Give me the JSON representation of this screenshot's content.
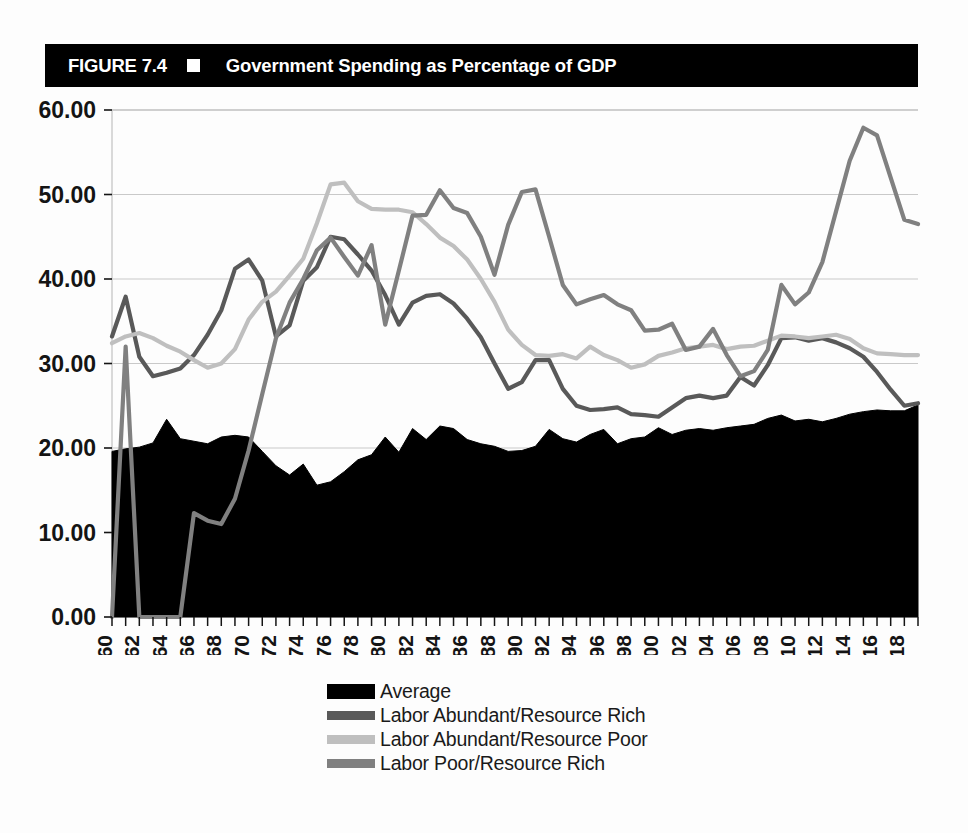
{
  "figure": {
    "label": "FIGURE 7.4",
    "title": "Government Spending as Percentage of GDP",
    "marker_icon": "white-square-icon"
  },
  "colors": {
    "title_bar_background": "#000000",
    "title_text": "#ffffff",
    "average_area": "#000000",
    "labor_abundant_resource_rich": "#595959",
    "labor_abundant_resource_poor": "#bfbfbf",
    "labor_poor_resource_rich": "#808080",
    "gridline": "#c9c9c9",
    "axis_text": "#141414",
    "plot_background": "#ffffff"
  },
  "legend": {
    "position": "below-axis",
    "items": [
      {
        "label": "Average",
        "color": "#000000",
        "style": "area",
        "swatch_icon": "black-area-swatch-icon"
      },
      {
        "label": "Labor Abundant/Resource Rich",
        "color": "#595959",
        "style": "line",
        "swatch_icon": "dark-gray-line-swatch-icon"
      },
      {
        "label": "Labor Abundant/Resource Poor",
        "color": "#bfbfbf",
        "style": "line",
        "swatch_icon": "light-gray-line-swatch-icon"
      },
      {
        "label": "Labor Poor/Resource Rich",
        "color": "#808080",
        "style": "line",
        "swatch_icon": "medium-gray-line-swatch-icon"
      }
    ]
  },
  "axes": {
    "y": {
      "min": 0,
      "max": 60,
      "step": 10,
      "tick_labels": [
        "60.00",
        "50.00",
        "40.00",
        "30.00",
        "20.00",
        "10.00",
        "0.00"
      ],
      "label": "",
      "grid": true
    },
    "x": {
      "min": 1960,
      "max": 2019,
      "label_step": 2,
      "tick_labels": [
        "1960",
        "1962",
        "1964",
        "1966",
        "1968",
        "1970",
        "1972",
        "1974",
        "1976",
        "1978",
        "1980",
        "1982",
        "1984",
        "1986",
        "1988",
        "1990",
        "1992",
        "1994",
        "1996",
        "1998",
        "2000",
        "2002",
        "2004",
        "2006",
        "2008",
        "2010",
        "2012",
        "2014",
        "2016",
        "2018"
      ],
      "label": "",
      "label_rotation": -90,
      "grid": false
    }
  },
  "chart_data": {
    "type": "line",
    "title": "Government Spending as Percentage of GDP",
    "xlabel": "",
    "ylabel": "",
    "ylim": [
      0,
      60
    ],
    "xlim": [
      1960,
      2019
    ],
    "grid": true,
    "legend_position": "bottom",
    "x": [
      1960,
      1961,
      1962,
      1963,
      1964,
      1965,
      1966,
      1967,
      1968,
      1969,
      1970,
      1971,
      1972,
      1973,
      1974,
      1975,
      1976,
      1977,
      1978,
      1979,
      1980,
      1981,
      1982,
      1983,
      1984,
      1985,
      1986,
      1987,
      1988,
      1989,
      1990,
      1991,
      1992,
      1993,
      1994,
      1995,
      1996,
      1997,
      1998,
      1999,
      2000,
      2001,
      2002,
      2003,
      2004,
      2005,
      2006,
      2007,
      2008,
      2009,
      2010,
      2011,
      2012,
      2013,
      2014,
      2015,
      2016,
      2017,
      2018,
      2019
    ],
    "series": [
      {
        "name": "Average",
        "color": "#000000",
        "type": "area",
        "values": [
          19.6,
          19.9,
          20.1,
          20.6,
          23.4,
          21.1,
          20.8,
          20.5,
          21.3,
          21.5,
          21.3,
          19.6,
          17.9,
          16.8,
          18.1,
          15.6,
          16.0,
          17.2,
          18.6,
          19.2,
          21.3,
          19.5,
          22.3,
          21.0,
          22.6,
          22.3,
          21.0,
          20.5,
          20.2,
          19.6,
          19.7,
          20.2,
          22.2,
          21.1,
          20.7,
          21.6,
          22.2,
          20.5,
          21.1,
          21.3,
          22.4,
          21.6,
          22.1,
          22.3,
          22.1,
          22.4,
          22.6,
          22.8,
          23.5,
          23.9,
          23.2,
          23.4,
          23.1,
          23.5,
          24.0,
          24.3,
          24.5,
          24.4,
          24.4,
          25.1
        ]
      },
      {
        "name": "Labor Abundant/Resource Rich",
        "color": "#595959",
        "type": "line",
        "values": [
          33.2,
          37.9,
          30.8,
          28.5,
          28.9,
          29.4,
          31.0,
          33.4,
          36.3,
          41.2,
          42.3,
          39.8,
          33.2,
          34.5,
          39.8,
          41.4,
          45.0,
          44.7,
          42.9,
          41.0,
          38.1,
          34.6,
          37.2,
          38.0,
          38.2,
          37.1,
          35.3,
          33.1,
          30.0,
          27.0,
          27.8,
          30.4,
          30.4,
          27.0,
          25.0,
          24.5,
          24.6,
          24.8,
          24.0,
          23.9,
          23.7,
          24.8,
          25.9,
          26.2,
          25.9,
          26.2,
          28.4,
          27.4,
          29.8,
          33.0,
          33.1,
          32.7,
          33.0,
          32.5,
          31.8,
          30.8,
          29.0,
          26.9,
          25.0,
          25.3
        ]
      },
      {
        "name": "Labor Abundant/Resource Poor",
        "color": "#bfbfbf",
        "type": "line",
        "values": [
          32.4,
          33.2,
          33.6,
          33.0,
          32.1,
          31.4,
          30.4,
          29.5,
          30.0,
          31.7,
          35.2,
          37.3,
          38.5,
          40.4,
          42.4,
          46.6,
          51.2,
          51.4,
          49.2,
          48.3,
          48.2,
          48.2,
          47.9,
          46.5,
          44.9,
          43.9,
          42.3,
          40.0,
          37.3,
          34.0,
          32.2,
          31.0,
          30.9,
          31.1,
          30.6,
          32.0,
          31.0,
          30.4,
          29.5,
          29.9,
          30.9,
          31.3,
          31.8,
          32.0,
          32.2,
          31.7,
          32.0,
          32.1,
          32.7,
          33.3,
          33.2,
          33.0,
          33.2,
          33.4,
          32.9,
          31.8,
          31.2,
          31.1,
          31.0,
          31.0
        ]
      },
      {
        "name": "Labor Poor/Resource Rich",
        "color": "#808080",
        "type": "line",
        "values": [
          0.0,
          32.0,
          0.0,
          0.0,
          0.0,
          0.0,
          12.3,
          11.4,
          11.0,
          14.0,
          19.7,
          26.4,
          33.0,
          37.2,
          40.0,
          43.4,
          44.9,
          42.6,
          40.4,
          44.0,
          34.6,
          41.0,
          47.5,
          47.6,
          50.5,
          48.4,
          47.8,
          45.0,
          40.5,
          46.4,
          50.3,
          50.6,
          45.0,
          39.3,
          37.0,
          37.6,
          38.1,
          37.0,
          36.3,
          33.9,
          34.0,
          34.7,
          31.6,
          32.0,
          34.1,
          31.0,
          28.5,
          29.1,
          31.6,
          39.3,
          37.0,
          38.4,
          42.0,
          48.0,
          54.0,
          57.9,
          57.0,
          52.0,
          47.0,
          46.5
        ]
      }
    ]
  }
}
